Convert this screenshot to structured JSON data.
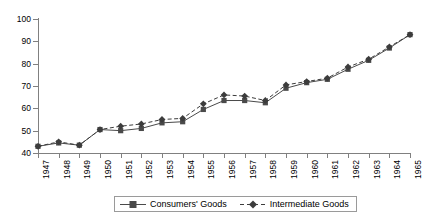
{
  "chart_data": {
    "type": "line",
    "title": "",
    "subtitle": "",
    "xlabel": "",
    "ylabel": "",
    "xlim": [
      1947,
      1965
    ],
    "ylim": [
      40,
      100
    ],
    "ytick_step": 10,
    "grid": false,
    "legend_position": "bottom-center",
    "categories": [
      "1947",
      "1948",
      "1949",
      "1950",
      "1951",
      "1952",
      "1953",
      "1954",
      "1955",
      "1956",
      "1957",
      "1958",
      "1959",
      "1960",
      "1961",
      "1962",
      "1963",
      "1964",
      "1965"
    ],
    "yticks": [
      "40",
      "50",
      "60",
      "70",
      "80",
      "90",
      "100"
    ],
    "series": [
      {
        "name": "Consumers' Goods",
        "marker": "square",
        "line_style": "solid",
        "color": "#4a4a4a",
        "values": [
          43,
          44.5,
          43.5,
          50.5,
          50,
          51,
          53.5,
          54,
          59.5,
          63.5,
          63.5,
          62.5,
          69,
          71.5,
          73,
          77.5,
          81.5,
          87,
          93
        ]
      },
      {
        "name": "Intermediate Goods",
        "marker": "diamond",
        "line_style": "dashed",
        "color": "#3c3c3c",
        "values": [
          43,
          45,
          43.5,
          50.5,
          52,
          53,
          55,
          55.5,
          62,
          66,
          65.5,
          63.5,
          70.5,
          72,
          73.5,
          78.5,
          82,
          87.5,
          93
        ]
      }
    ]
  },
  "legend": {
    "items": [
      {
        "label": "Consumers' Goods"
      },
      {
        "label": "Intermediate Goods"
      }
    ]
  }
}
